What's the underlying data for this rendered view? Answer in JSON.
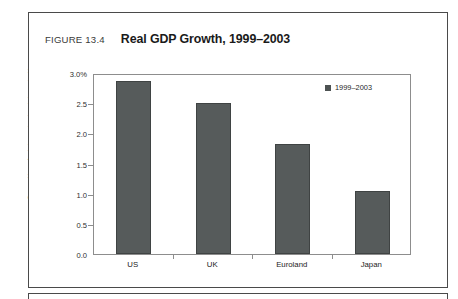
{
  "figure": {
    "number": "FIGURE 13.4",
    "title": "Real GDP Growth, 1999–2003",
    "source": "Source: Haver Analytics; national statistics authorities"
  },
  "colors": {
    "bar_fill": "#565b5b",
    "bar_border": "#3f4343",
    "axis": "#8d8d8d",
    "frame": "#4a4a4a",
    "text": "#1a1a1a"
  },
  "chart_data": {
    "type": "bar",
    "title": "Real GDP Growth, 1999–2003",
    "xlabel": "",
    "ylabel": "",
    "categories": [
      "US",
      "UK",
      "Euroland",
      "Japan"
    ],
    "values": [
      2.87,
      2.5,
      1.83,
      1.05
    ],
    "series": [
      {
        "name": "1999–2003",
        "values": [
          2.87,
          2.5,
          1.83,
          1.05
        ]
      }
    ],
    "ylim": [
      0.0,
      3.0
    ],
    "ytick_values": [
      3.0,
      2.5,
      2.0,
      1.5,
      1.0,
      0.5,
      0.0
    ],
    "ytick_labels": [
      "3.0%",
      "2.5",
      "2.0",
      "1.5",
      "1.0",
      "0.5",
      "0.0"
    ],
    "grid": false,
    "legend": {
      "position": "top-right",
      "entries": [
        "1999–2003"
      ]
    }
  }
}
